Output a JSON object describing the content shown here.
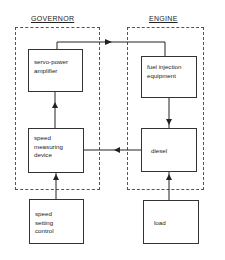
{
  "diagram": {
    "groups": [
      {
        "id": "governor",
        "title": "GOVERNOR"
      },
      {
        "id": "engine",
        "title": "ENGINE"
      }
    ],
    "blocks": {
      "servo_power_amplifier": "servo-power\namplifier",
      "speed_measuring_device": "speed\nmeasuring\ndevice",
      "speed_setting_control": "speed\nsetting\ncontrol",
      "fuel_injection_equipment": "fuel injection\nequipment",
      "diesel": "diesel",
      "load": "load"
    },
    "connections": [
      {
        "from": "servo_power_amplifier",
        "to": "fuel_injection_equipment"
      },
      {
        "from": "fuel_injection_equipment",
        "to": "diesel"
      },
      {
        "from": "diesel",
        "to": "speed_measuring_device"
      },
      {
        "from": "speed_measuring_device",
        "to": "servo_power_amplifier"
      },
      {
        "from": "speed_setting_control",
        "to": "speed_measuring_device"
      },
      {
        "from": "load",
        "to": "diesel"
      }
    ]
  }
}
